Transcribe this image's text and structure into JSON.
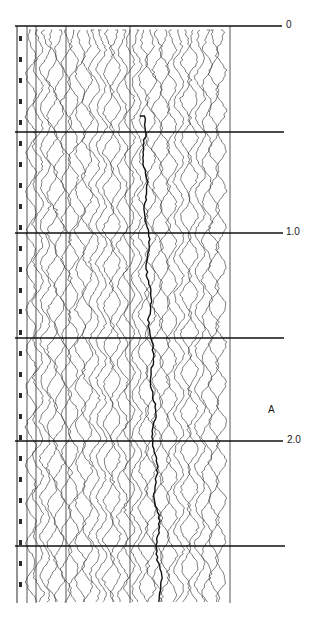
{
  "figure": {
    "type": "seismic-record",
    "ink_color": "#2a2a2a",
    "background": "#ffffff",
    "record": {
      "left": 17,
      "right": 232,
      "top": 26,
      "bottom": 603
    },
    "inner_lines_x": [
      27,
      36,
      66,
      130,
      230
    ],
    "trace_count": 28,
    "timing_lines": [
      {
        "y": 26,
        "x_end": 282,
        "label": "0"
      },
      {
        "y": 132,
        "x_end": 284,
        "label": ""
      },
      {
        "y": 233,
        "x_end": 283,
        "label": "1.0"
      },
      {
        "y": 338,
        "x_end": 284,
        "label": ""
      },
      {
        "y": 441,
        "x_end": 283,
        "label": "2.0"
      },
      {
        "y": 546,
        "x_end": 285,
        "label": ""
      }
    ],
    "annotations": [
      {
        "text": "A",
        "x": 268,
        "y": 405
      }
    ],
    "labels": {
      "t0": "0",
      "t1": "1.0",
      "t2": "2.0",
      "marker_a": "A"
    }
  }
}
